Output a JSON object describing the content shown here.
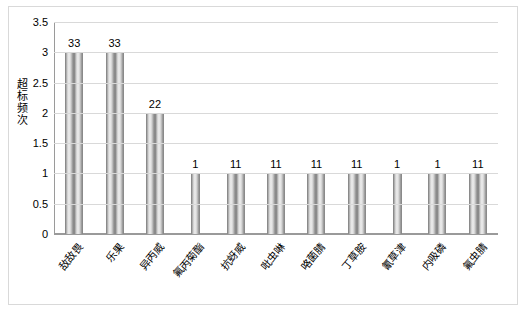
{
  "chart_data": {
    "type": "bar",
    "title": "",
    "xlabel": "",
    "ylabel": "超标频次",
    "ylim": [
      0,
      3.5
    ],
    "yticks": [
      "0",
      "0.5",
      "1",
      "1.5",
      "2",
      "2.5",
      "3",
      "3.5"
    ],
    "grid": true,
    "legend": false,
    "categories": [
      "敌敌畏",
      "乐果",
      "异丙威",
      "氟丙菊酯",
      "抗蚜威",
      "吡虫啉",
      "咯菌腈",
      "丁草胺",
      "氰草津",
      "内吸磷",
      "氟虫腈"
    ],
    "values": [
      3,
      3,
      2,
      1,
      1,
      1,
      1,
      1,
      1,
      1,
      1
    ],
    "bar_labels": [
      "33",
      "33",
      "22",
      "1",
      "11",
      "11",
      "11",
      "11",
      "1",
      "1",
      "11"
    ],
    "bar_group_counts": [
      2,
      2,
      2,
      1,
      2,
      2,
      2,
      2,
      1,
      2,
      2
    ]
  }
}
